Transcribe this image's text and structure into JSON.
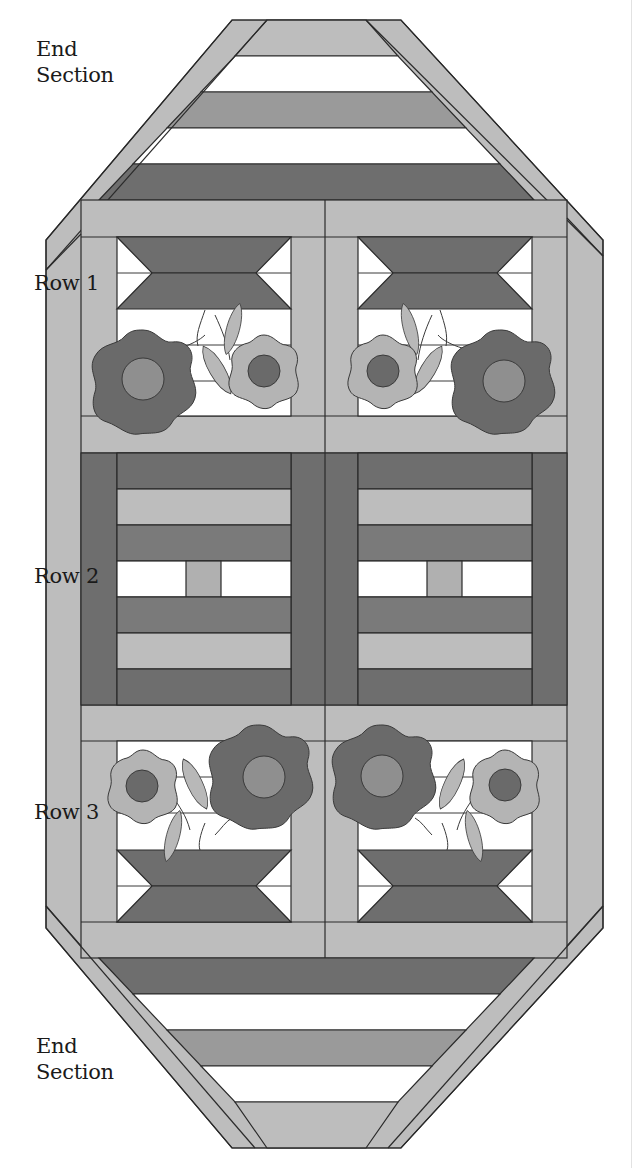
{
  "diagram": {
    "colors": {
      "light": "#bdbdbd",
      "medium": "#9a9a9a",
      "dark": "#6e6e6e",
      "white": "#ffffff",
      "outline": "#2a2a2a",
      "flower_large": "#6a6a6a",
      "flower_large_center": "#8f8f8f",
      "flower_small": "#b4b4b4",
      "flower_small_center": "#6a6a6a",
      "leaf": "#b8b8b8"
    },
    "labels": {
      "top_end": "End\nSection",
      "row1": "Row 1",
      "row2": "Row 2",
      "row3": "Row 3",
      "bottom_end": "End\nSection"
    },
    "sections": [
      {
        "name": "End Section",
        "position": "top",
        "bands": [
          "light",
          "white",
          "medium",
          "white",
          "dark"
        ]
      },
      {
        "name": "Row 1",
        "blocks": 2,
        "type": "basket-with-flowers",
        "orientation": "upright"
      },
      {
        "name": "Row 2",
        "blocks": 2,
        "type": "striped-log-cabin"
      },
      {
        "name": "Row 3",
        "blocks": 2,
        "type": "basket-with-flowers",
        "orientation": "inverted"
      },
      {
        "name": "End Section",
        "position": "bottom",
        "bands": [
          "dark",
          "white",
          "medium",
          "white",
          "light"
        ]
      }
    ]
  }
}
